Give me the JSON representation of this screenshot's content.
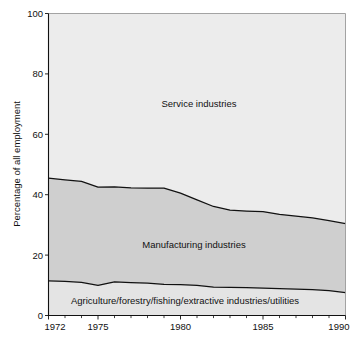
{
  "chart_data": {
    "type": "area",
    "title": "",
    "subtitle": "",
    "xlabel": "",
    "ylabel": "Percentage of all employment",
    "stacked": true,
    "grid": false,
    "legend_position": "inline-annotations",
    "xlim": [
      1972,
      1990
    ],
    "ylim": [
      0,
      100
    ],
    "ytick_labels": [
      "0",
      "20",
      "40",
      "60",
      "80",
      "100"
    ],
    "ytick_values": [
      0,
      20,
      40,
      60,
      80,
      100
    ],
    "xtick_labels": [
      "1972",
      "1975",
      "1980",
      "1985",
      "1990"
    ],
    "xtick_values": [
      1972,
      1975,
      1980,
      1985,
      1990
    ],
    "xtick_minor_values": [
      1973,
      1974,
      1976,
      1977,
      1978,
      1979,
      1981,
      1982,
      1983,
      1984,
      1986,
      1987,
      1988,
      1989
    ],
    "x": [
      1972,
      1973,
      1974,
      1975,
      1976,
      1977,
      1978,
      1979,
      1980,
      1981,
      1982,
      1983,
      1984,
      1985,
      1986,
      1987,
      1988,
      1989,
      1990
    ],
    "series": [
      {
        "name": "Agriculture/forestry/fishing/extractive industries/utilities",
        "color": "#e4e4e4",
        "values": [
          11.5,
          11.3,
          11.0,
          10.0,
          11.1,
          10.9,
          10.7,
          10.3,
          10.2,
          10.0,
          9.4,
          9.3,
          9.2,
          9.1,
          8.9,
          8.7,
          8.6,
          8.2,
          7.6
        ]
      },
      {
        "name": "Manufacturing industries",
        "color": "#cfcfcf",
        "values": [
          34.0,
          33.6,
          33.4,
          32.5,
          31.5,
          31.4,
          31.5,
          31.9,
          30.3,
          28.3,
          26.7,
          25.6,
          25.4,
          25.3,
          24.6,
          24.2,
          23.7,
          23.2,
          22.8
        ]
      },
      {
        "name": "Service industries",
        "color": "#ececec",
        "values": [
          54.5,
          55.1,
          55.6,
          57.5,
          57.4,
          57.7,
          57.8,
          57.8,
          59.5,
          61.7,
          63.9,
          65.1,
          65.4,
          65.6,
          66.5,
          67.1,
          67.7,
          68.6,
          69.6
        ]
      }
    ],
    "boundaries": {
      "lower_cumulative": [
        11.5,
        11.3,
        11.0,
        10.0,
        11.1,
        10.9,
        10.7,
        10.3,
        10.2,
        10.0,
        9.4,
        9.3,
        9.2,
        9.1,
        8.9,
        8.7,
        8.6,
        8.2,
        7.6
      ],
      "upper_cumulative": [
        45.5,
        44.9,
        44.4,
        42.5,
        42.6,
        42.3,
        42.2,
        42.2,
        40.5,
        38.3,
        36.1,
        34.9,
        34.6,
        34.4,
        33.5,
        32.9,
        32.3,
        31.4,
        30.4
      ]
    },
    "annotations": [
      {
        "name": "service-industries-label",
        "text": "Service industries",
        "x_px": 199,
        "y_px": 107
      },
      {
        "name": "manufacturing-industries-label",
        "text": "Manufacturing industries",
        "x_px": 194,
        "y_px": 248
      },
      {
        "name": "primary-industries-label",
        "text": "Agriculture/forestry/fishing/extractive industries/utilities",
        "x_px": 185,
        "y_px": 304
      }
    ]
  },
  "axes": {
    "y_axis_title": "Percentage of all employment",
    "y_ticks": [
      "100",
      "80",
      "60",
      "40",
      "20",
      "0"
    ],
    "x_ticks": [
      "1972",
      "1975",
      "1980",
      "1985",
      "1990"
    ]
  },
  "colors": {
    "service_fill": "#ececec",
    "manufacturing_fill": "#cfcfcf",
    "primary_fill": "#e4e4e4",
    "line": "#111111",
    "axis": "#111111",
    "plot_border": "#9a9a9a",
    "background": "#ffffff"
  }
}
